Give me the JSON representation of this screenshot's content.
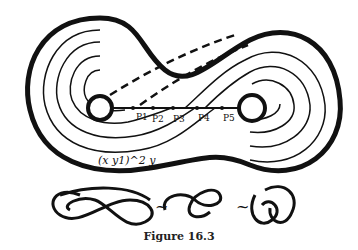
{
  "figure": {
    "caption": "Figure 16.3",
    "points": [
      "P1",
      "P2",
      "P3",
      "P4",
      "P5"
    ],
    "formula": "(x y1)^2 y",
    "equivalence_symbol": "~"
  }
}
